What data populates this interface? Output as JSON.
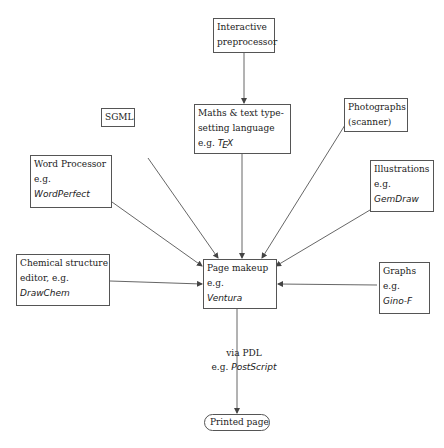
{
  "diagram": {
    "type": "flowchart",
    "nodes": {
      "interactive": {
        "line1": "Interactive",
        "line2": "preprocessor"
      },
      "maths": {
        "line1": "Maths & text type-",
        "line2": "setting language",
        "eg": "e.g.",
        "example_t": "T",
        "example_e": "E",
        "example_x": "X"
      },
      "sgml": {
        "line1": "SGML"
      },
      "photographs": {
        "line1": "Photographs",
        "line2": "(scanner)"
      },
      "word": {
        "line1": "Word Processor",
        "eg": "e.g.",
        "example": "WordPerfect"
      },
      "illustrations": {
        "line1": "Illustrations",
        "eg": "e.g.",
        "example": "GemDraw"
      },
      "chemical": {
        "line1": "Chemical structure",
        "line2": "editor, e.g.",
        "example": "DrawChem"
      },
      "pagemakeup": {
        "line1": "Page makeup",
        "eg": "e.g.",
        "example": "Ventura"
      },
      "graphs": {
        "line1": "Graphs",
        "eg": "e.g.",
        "example": "Gino-F"
      },
      "printed": {
        "line1": "Printed page"
      }
    },
    "edge_label": {
      "line1": "via PDL",
      "eg": "e.g.",
      "example": "PostScript"
    },
    "edges": [
      [
        "Interactive preprocessor",
        "Maths & text typesetting language"
      ],
      [
        "SGML",
        "Page makeup"
      ],
      [
        "Maths & text typesetting language",
        "Page makeup"
      ],
      [
        "Photographs (scanner)",
        "Page makeup"
      ],
      [
        "Word Processor",
        "Page makeup"
      ],
      [
        "Illustrations",
        "Page makeup"
      ],
      [
        "Chemical structure editor",
        "Page makeup"
      ],
      [
        "Graphs",
        "Page makeup"
      ],
      [
        "Page makeup",
        "Printed page"
      ]
    ],
    "colors": {
      "line": "#555555",
      "text": "#222222",
      "background": "#ffffff"
    }
  }
}
